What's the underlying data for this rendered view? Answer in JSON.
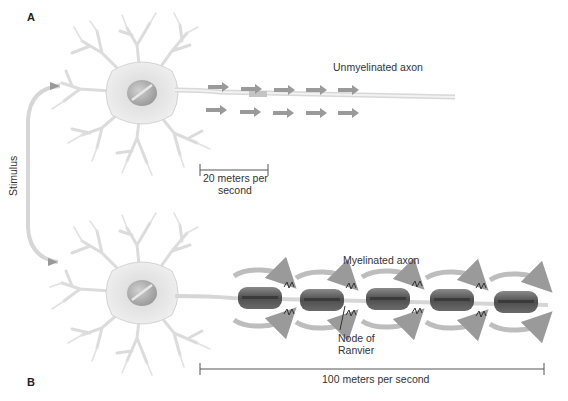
{
  "figure": {
    "panel_a": {
      "label": "A",
      "axon_label": "Unmyelinated axon",
      "speed_label_line1": "20 meters per",
      "speed_label_line2": "second",
      "arrow_rows": 2,
      "arrows_per_row": 5
    },
    "panel_b": {
      "label": "B",
      "axon_label": "Myelinated axon",
      "node_label_line1": "Node of",
      "node_label_line2": "Ranvier",
      "speed_label": "100 meters per second",
      "myelin_segments": 5
    },
    "stimulus_label": "Stimulus",
    "colors": {
      "neuron_fill": "#e6e6e6",
      "neuron_stroke": "#cfcfcf",
      "nucleus": "#b5b5b5",
      "arrow": "#9a9a9a",
      "myelin": "#6e6e6e",
      "myelin_dark": "#4a4a4a",
      "text": "#333333"
    }
  }
}
